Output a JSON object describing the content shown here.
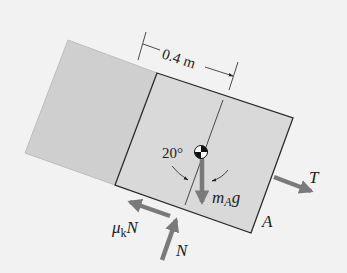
{
  "diagram": {
    "dimension_label": "0.4 m",
    "angle_label": "20°",
    "weight_label_main": "m",
    "weight_label_sub": "A",
    "weight_label_tail": "g",
    "tension_label": "T",
    "block_label": "A",
    "friction_label_main": "μ",
    "friction_label_sub": "k",
    "friction_label_tail": "N",
    "normal_label": "N"
  },
  "colors": {
    "background": "#f2f2f2",
    "block_left": "#cfcfcf",
    "block_A": "#d9d9d9",
    "outline": "#2a2a2a",
    "arrow": "#7a7a7a"
  }
}
